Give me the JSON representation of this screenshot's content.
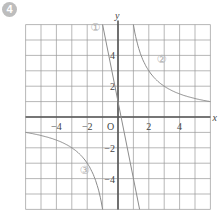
{
  "problem_label": "4",
  "chart_data": {
    "type": "line",
    "title": "",
    "xlabel": "x",
    "ylabel": "y",
    "origin_label": "O",
    "xlim": [
      -6,
      6
    ],
    "ylim": [
      -6,
      6
    ],
    "grid": true,
    "grid_step": 1,
    "x_ticks": [
      {
        "value": -4,
        "label": "−4"
      },
      {
        "value": -2,
        "label": "−2"
      },
      {
        "value": 2,
        "label": "2"
      },
      {
        "value": 4,
        "label": "4"
      }
    ],
    "y_ticks": [
      {
        "value": 4,
        "label": "4"
      },
      {
        "value": 2,
        "label": "2"
      },
      {
        "value": -2,
        "label": "−2"
      },
      {
        "value": -4,
        "label": "−4"
      }
    ],
    "series": [
      {
        "name": "①",
        "kind": "line",
        "equation": "y = -5x + 1",
        "points": [
          [
            -1,
            6
          ],
          [
            0,
            1
          ],
          [
            0.2,
            0
          ],
          [
            1,
            -4
          ],
          [
            1.4,
            -6
          ]
        ],
        "label_pos": [
          -1.8,
          5.6
        ]
      },
      {
        "name": "②",
        "kind": "hyperbola",
        "equation": "y = 6/x (x>0)",
        "points": [
          [
            1,
            6
          ],
          [
            1.5,
            4
          ],
          [
            2,
            3
          ],
          [
            3,
            2
          ],
          [
            4,
            1.5
          ],
          [
            6,
            1
          ]
        ],
        "label_pos": [
          2.5,
          3.5
        ]
      },
      {
        "name": "③",
        "kind": "hyperbola",
        "equation": "y = 6/x (x<0)",
        "points": [
          [
            -6,
            -1
          ],
          [
            -4,
            -1.5
          ],
          [
            -3,
            -2
          ],
          [
            -2,
            -3
          ],
          [
            -1.5,
            -4
          ],
          [
            -1,
            -6
          ]
        ],
        "label_pos": [
          -2.5,
          -3.7
        ]
      }
    ],
    "colors": {
      "grid": "#9a9a9a",
      "axis": "#555555",
      "curve": "#8c8c8c",
      "curve_label": "#b0b0b0",
      "text": "#444444"
    }
  }
}
